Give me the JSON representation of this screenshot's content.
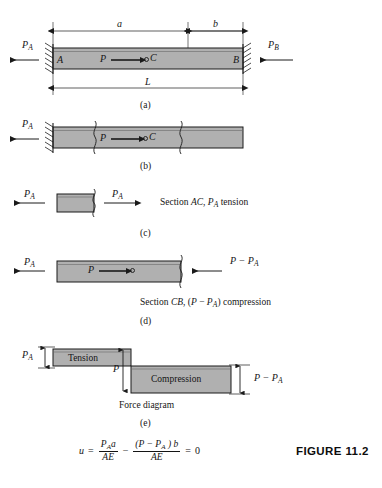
{
  "figure": {
    "caption": "FIGURE 11.2",
    "number": "11.2"
  },
  "parts": [
    {
      "key": "a",
      "label": "(a)"
    },
    {
      "key": "b",
      "label": "(b)"
    },
    {
      "key": "c",
      "label": "(c)"
    },
    {
      "key": "d",
      "label": "(d)"
    },
    {
      "key": "e",
      "label": "(e)"
    }
  ],
  "part_a": {
    "reaction_left": {
      "symbol": "P",
      "subscript": "A"
    },
    "reaction_right": {
      "symbol": "P",
      "subscript": "B"
    },
    "node_left": "A",
    "node_right": "B",
    "node_mid": "C",
    "applied_load": "P",
    "dim_a": "a",
    "dim_b": "b",
    "dim_L": "L"
  },
  "part_b": {
    "reaction_left": {
      "symbol": "P",
      "subscript": "A"
    },
    "applied_load": "P",
    "node_mid": "C"
  },
  "part_c": {
    "force_left": {
      "symbol": "P",
      "subscript": "A"
    },
    "force_right": {
      "symbol": "P",
      "subscript": "A"
    },
    "section_text_plain_1": "Section ",
    "section_text_italic_1": "AC",
    "section_text_plain_2": ", ",
    "section_text_italic_2": "P",
    "section_text_sub": "A",
    "section_text_plain_3": " tension"
  },
  "part_d": {
    "force_left": {
      "symbol": "P",
      "subscript": "A"
    },
    "applied_load": "P",
    "force_right": "P − P",
    "force_right_sub": "A",
    "section_text_plain_1": "Section ",
    "section_text_italic_1": "CB",
    "section_text_plain_2": ", (",
    "section_text_italic_2": "P",
    "section_text_plain_3": " − ",
    "section_text_italic_3": "P",
    "section_text_sub": "A",
    "section_text_plain_4": ") compression"
  },
  "part_e": {
    "tension_label": "Tension",
    "compression_label": "Compression",
    "left_force": {
      "symbol": "P",
      "subscript": "A"
    },
    "mid_force": "P",
    "right_force": "P − P",
    "right_force_sub": "A",
    "diagram_title": "Force diagram"
  },
  "equation": {
    "lhs": "u",
    "equals": "=",
    "term1_num": "P",
    "term1_num_sub": "A",
    "term1_num_tail": "a",
    "term1_den": "AE",
    "minus": "−",
    "term2_num_open": "(",
    "term2_num_p": "P",
    "term2_num_minus": " − ",
    "term2_num_pa": "P",
    "term2_num_pa_sub": "A",
    "term2_num_close": " ) ",
    "term2_num_b": "b",
    "term2_den": "AE",
    "result_equals": "=",
    "result": "0"
  },
  "colors": {
    "beam_fill": "#b0b0b0",
    "beam_stroke": "#1a1a1a",
    "line": "#1a1a1a",
    "text": "#161616",
    "background": "#ffffff"
  }
}
